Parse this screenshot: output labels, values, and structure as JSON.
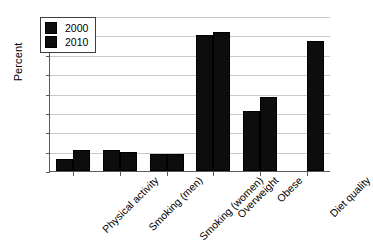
{
  "chart_data": {
    "type": "bar",
    "title": "",
    "xlabel": "",
    "ylabel": "Percent",
    "ylim": [
      0,
      80
    ],
    "yticks": [
      0,
      10,
      20,
      30,
      40,
      50,
      60,
      70,
      80
    ],
    "grid": true,
    "legend_position": "upper-left-inside",
    "categories": [
      "Physical activity",
      "Smoking (men)",
      "Smoking (women)",
      "Overweight",
      "Obese",
      "Diet quality"
    ],
    "series": [
      {
        "name": "2000",
        "color": "#0d0d0d",
        "values": [
          6,
          11,
          9,
          70,
          31,
          null
        ]
      },
      {
        "name": "2010",
        "color": "#0d0d0d",
        "values": [
          11,
          10,
          9,
          72,
          38,
          67
        ]
      }
    ]
  },
  "axis": {
    "y_title": "Percent",
    "y_tick_labels": [
      "80",
      "70",
      "60",
      "50",
      "40",
      "30",
      "20",
      "10",
      "0"
    ]
  },
  "legend": {
    "entries": [
      {
        "label": "2000",
        "swatch": "legend-swatch-2000"
      },
      {
        "label": "2010",
        "swatch": "legend-swatch-2010"
      }
    ]
  }
}
